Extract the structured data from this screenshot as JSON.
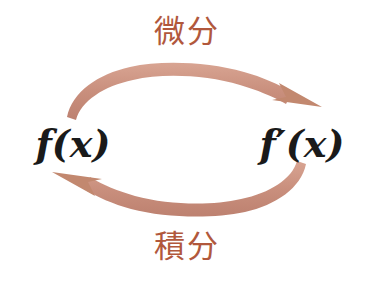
{
  "diagram": {
    "background_color": "#ffffff",
    "arrow_color": "#c98f7d",
    "label_color": "#b1583c",
    "expression_color": "#1a1a1a",
    "labels": {
      "top": "微分",
      "bottom": "積分"
    },
    "nodes": {
      "left": "f(x)",
      "right": "f′(x)"
    },
    "arrows": [
      {
        "name": "differentiate-arrow",
        "from": "f(x)",
        "to": "f′(x)",
        "label": "微分",
        "direction": "left-to-right",
        "position": "top"
      },
      {
        "name": "integrate-arrow",
        "from": "f′(x)",
        "to": "f(x)",
        "label": "積分",
        "direction": "right-to-left",
        "position": "bottom"
      }
    ]
  }
}
